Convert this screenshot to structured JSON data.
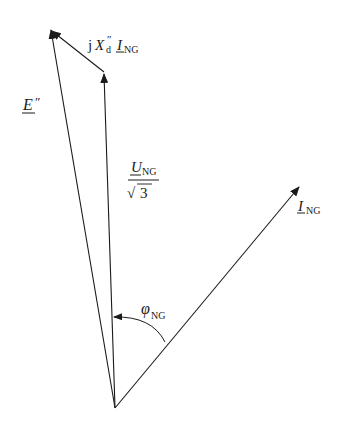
{
  "diagram": {
    "type": "phasor-diagram",
    "labels": {
      "e_main": "E",
      "e_prime": "″",
      "jx_j": "j",
      "jx_x": "X",
      "jx_sub": "d",
      "jx_prime": "″",
      "jx_i": "I",
      "jx_i_sub": "NG",
      "u_num": "U",
      "u_sub": "NG",
      "u_den_root": "√",
      "u_den": "3",
      "i_main": "I",
      "i_sub": "NG",
      "phi_main": "φ",
      "phi_sub": "NG"
    },
    "phasors": [
      {
        "name": "E''",
        "description": "subtransient EMF"
      },
      {
        "name": "U_NG/sqrt(3)",
        "description": "rated phase voltage"
      },
      {
        "name": "jX''d I_NG",
        "description": "subtransient reactance voltage drop"
      },
      {
        "name": "I_NG",
        "description": "rated current"
      }
    ],
    "angle": {
      "name": "phi_NG",
      "between": [
        "I_NG",
        "U_NG/sqrt(3)"
      ]
    },
    "colors": {
      "stroke": "#1a1a1a",
      "background": "#ffffff"
    }
  }
}
